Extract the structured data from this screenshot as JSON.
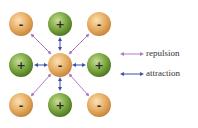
{
  "diagram": {
    "center": {
      "charge": "-",
      "color": "#e3a85e"
    },
    "neighbors": [
      {
        "pos": "top-left",
        "charge": "-",
        "interaction": "repulsion"
      },
      {
        "pos": "top",
        "charge": "+",
        "interaction": "attraction"
      },
      {
        "pos": "top-right",
        "charge": "-",
        "interaction": "repulsion"
      },
      {
        "pos": "left",
        "charge": "+",
        "interaction": "attraction"
      },
      {
        "pos": "right",
        "charge": "+",
        "interaction": "attraction"
      },
      {
        "pos": "bottom-left",
        "charge": "-",
        "interaction": "repulsion"
      },
      {
        "pos": "bottom",
        "charge": "+",
        "interaction": "attraction"
      },
      {
        "pos": "bottom-right",
        "charge": "-",
        "interaction": "repulsion"
      }
    ],
    "colors": {
      "negative": "#e3a85e",
      "positive": "#6f9a3a",
      "repulsion": "#b07cc0",
      "attraction": "#3d4fa8"
    }
  },
  "legend": {
    "repulsion": "repulsion",
    "attraction": "attraction"
  }
}
